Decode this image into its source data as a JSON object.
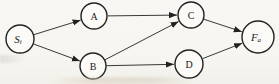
{
  "figure": {
    "kind": "directed-graph",
    "colors": {
      "paper": "#f7f6f1",
      "ink": "#222222",
      "node_fill": "#fbfaf6"
    },
    "nodes": [
      {
        "id": "Si",
        "base": "S",
        "sub": "i",
        "italic": true,
        "x": 20,
        "y": 39,
        "r": 14
      },
      {
        "id": "A",
        "base": "A",
        "sub": "",
        "italic": false,
        "x": 94,
        "y": 16,
        "r": 13
      },
      {
        "id": "B",
        "base": "B",
        "sub": "",
        "italic": false,
        "x": 93,
        "y": 66,
        "r": 13
      },
      {
        "id": "C",
        "base": "C",
        "sub": "",
        "italic": false,
        "x": 191,
        "y": 15,
        "r": 13
      },
      {
        "id": "D",
        "base": "D",
        "sub": "",
        "italic": false,
        "x": 189,
        "y": 64,
        "r": 14
      },
      {
        "id": "Fa",
        "base": "F",
        "sub": "a",
        "italic": true,
        "x": 258,
        "y": 37,
        "r": 16
      }
    ],
    "edges": [
      {
        "from": "Si",
        "to": "A"
      },
      {
        "from": "Si",
        "to": "B"
      },
      {
        "from": "A",
        "to": "C"
      },
      {
        "from": "B",
        "to": "C"
      },
      {
        "from": "B",
        "to": "D"
      },
      {
        "from": "C",
        "to": "Fa"
      },
      {
        "from": "D",
        "to": "Fa"
      }
    ]
  }
}
